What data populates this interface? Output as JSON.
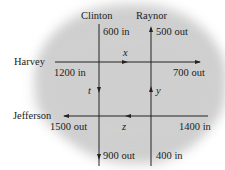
{
  "streets": {
    "clinton": "Clinton",
    "raynor": "Raynor",
    "harvey": "Harvey",
    "jefferson": "Jefferson"
  },
  "flows": {
    "clinton_in": "600 in",
    "raynor_out": "500 out",
    "harvey_in": "1200 in",
    "harvey_out": "700 out",
    "jefferson_out": "1500 out",
    "jefferson_in": "1400 in",
    "clinton_out": "900 out",
    "raynor_in": "400 in"
  },
  "variables": {
    "top": "x",
    "left": "t",
    "right": "y",
    "bottom": "z"
  },
  "colors": {
    "background_blob": "#cfcfcf",
    "lines": "#222222"
  }
}
